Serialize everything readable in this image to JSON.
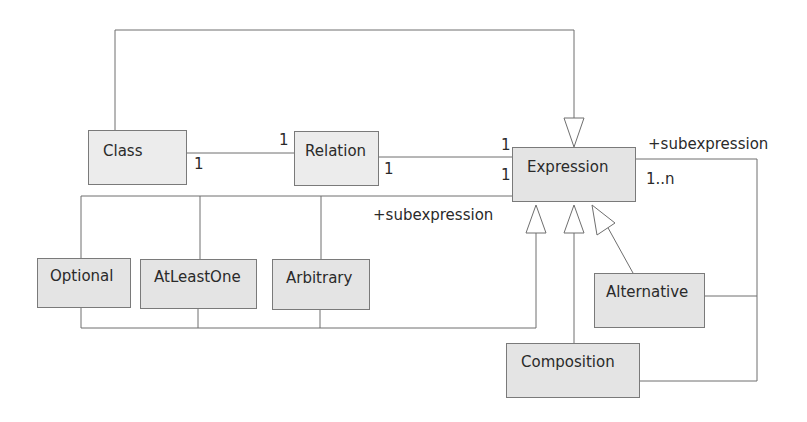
{
  "diagram": {
    "type": "UML class diagram",
    "classes": [
      {
        "id": "class",
        "label": "Class"
      },
      {
        "id": "relation",
        "label": "Relation"
      },
      {
        "id": "expression",
        "label": "Expression"
      },
      {
        "id": "optional",
        "label": "Optional"
      },
      {
        "id": "atleastone",
        "label": "AtLeastOne"
      },
      {
        "id": "arbitrary",
        "label": "Arbitrary"
      },
      {
        "id": "alternative",
        "label": "Alternative"
      },
      {
        "id": "composition",
        "label": "Composition"
      }
    ],
    "labels": {
      "class_relation_class_end": "1",
      "class_relation_relation_end": "1",
      "relation_expression_relation_end": "1",
      "relation_expression_expression_end": "1",
      "unary_expression_end": "1",
      "unary_role": "+subexpression",
      "nary_role": "+subexpression",
      "nary_multiplicity": "1..n"
    },
    "relationships": [
      {
        "from": "Class",
        "to": "Expression",
        "kind": "generalization"
      },
      {
        "from": "Class",
        "to": "Relation",
        "kind": "association",
        "multiplicity": [
          "1",
          "1"
        ]
      },
      {
        "from": "Relation",
        "to": "Expression",
        "kind": "association",
        "multiplicity": [
          "1",
          "1"
        ]
      },
      {
        "from": "Optional/AtLeastOne/Arbitrary",
        "to": "Expression",
        "kind": "association",
        "role": "+subexpression",
        "multiplicity": "1"
      },
      {
        "from": "Optional/AtLeastOne/Arbitrary",
        "to": "Expression",
        "kind": "generalization"
      },
      {
        "from": "Composition",
        "to": "Expression",
        "kind": "generalization"
      },
      {
        "from": "Alternative",
        "to": "Expression",
        "kind": "generalization"
      },
      {
        "from": "Alternative/Composition",
        "to": "Expression",
        "kind": "association",
        "role": "+subexpression",
        "multiplicity": "1..n"
      }
    ]
  }
}
